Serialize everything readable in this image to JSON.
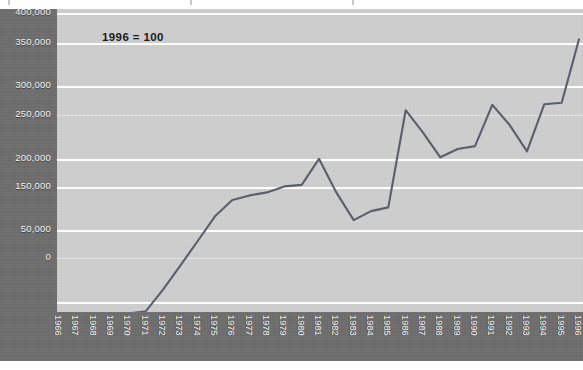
{
  "chart_data": {
    "type": "line",
    "title": "",
    "subtitle": "",
    "annotation": "1996 = 100",
    "xlabel": "",
    "ylabel": "",
    "grid": true,
    "legend": "none",
    "axis_note": "y-axis tick labels as printed; the 100,000 tick is printed as 50,000 in the source",
    "ytick_labels": [
      "400,000",
      "350,000",
      "300,000",
      "250,000",
      "200,000",
      "150,000",
      "50,000",
      "0"
    ],
    "ytick_values": [
      400000,
      350000,
      300000,
      250000,
      200000,
      150000,
      100000,
      0
    ],
    "ylim": [
      -20000,
      400000
    ],
    "xlim": [
      "1966",
      "1996"
    ],
    "categories": [
      "1966",
      "1967",
      "1968",
      "1969",
      "1970",
      "1971",
      "1972",
      "1973",
      "1974",
      "1975",
      "1976",
      "1977",
      "1978",
      "1979",
      "1980",
      "1981",
      "1982",
      "1983",
      "1984",
      "1985",
      "1986",
      "1987",
      "1988",
      "1989",
      "1990",
      "1991",
      "1992",
      "1993",
      "1994",
      "1995",
      "1996"
    ],
    "values": [
      -14000,
      -10000,
      -6000,
      -2000,
      1000,
      3000,
      30000,
      62000,
      95000,
      128000,
      150000,
      156000,
      160000,
      168000,
      170000,
      205000,
      160000,
      123000,
      135000,
      140000,
      270000,
      240000,
      207000,
      218000,
      222000,
      277000,
      250000,
      215000,
      278000,
      280000,
      282000
    ],
    "series": [
      {
        "name": "index",
        "color": "#5a5f6b",
        "points": [
          {
            "x": "1966",
            "y": -14000
          },
          {
            "x": "1967",
            "y": -11000
          },
          {
            "x": "1968",
            "y": -8000
          },
          {
            "x": "1969",
            "y": -5000
          },
          {
            "x": "1970",
            "y": -2000
          },
          {
            "x": "1971",
            "y": 1000
          },
          {
            "x": "1972",
            "y": 30000
          },
          {
            "x": "1973",
            "y": 62000
          },
          {
            "x": "1974",
            "y": 95000
          },
          {
            "x": "1975",
            "y": 128000
          },
          {
            "x": "1976",
            "y": 150000
          },
          {
            "x": "1977",
            "y": 156000
          },
          {
            "x": "1978",
            "y": 160000
          },
          {
            "x": "1979",
            "y": 168000
          },
          {
            "x": "1980",
            "y": 170000
          },
          {
            "x": "1981",
            "y": 205000
          },
          {
            "x": "1982",
            "y": 160000
          },
          {
            "x": "1983",
            "y": 123000
          },
          {
            "x": "1984",
            "y": 135000
          },
          {
            "x": "1985",
            "y": 140000
          },
          {
            "x": "1986",
            "y": 270000
          },
          {
            "x": "1987",
            "y": 240000
          },
          {
            "x": "1988",
            "y": 207000
          },
          {
            "x": "1989",
            "y": 218000
          },
          {
            "x": "1990",
            "y": 222000
          },
          {
            "x": "1991",
            "y": 277000
          },
          {
            "x": "1992",
            "y": 250000
          },
          {
            "x": "1993",
            "y": 215000
          },
          {
            "x": "1994",
            "y": 278000
          },
          {
            "x": "1995",
            "y": 280000
          },
          {
            "x": "1996",
            "y": 365000
          }
        ]
      }
    ],
    "colors": {
      "line": "#5a5f6b",
      "plot_background": "#cdcdce",
      "axis_band": "#6e6e6e",
      "gridline": "#fdfdfd",
      "axis_text": "#f2f2f2",
      "annotation_text": "#1a1a1a"
    }
  }
}
